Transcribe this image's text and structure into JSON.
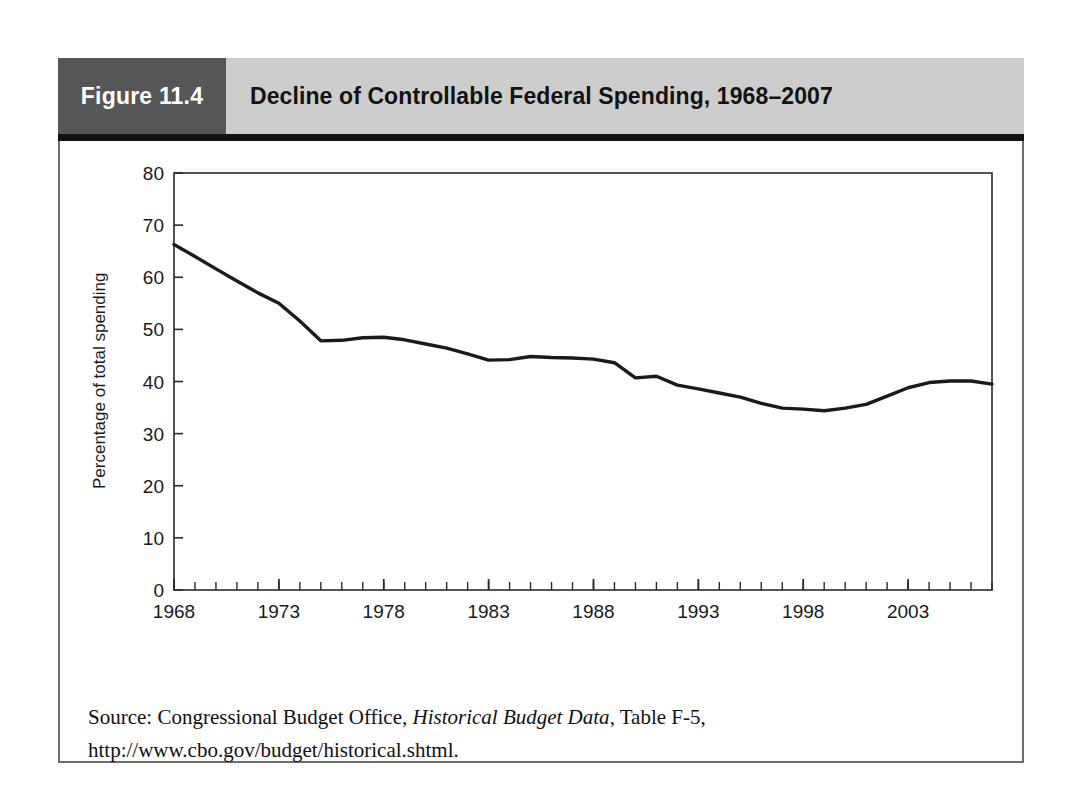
{
  "figure": {
    "number_label": "Figure 11.4",
    "title": "Decline of Controllable Federal Spending, 1968–2007",
    "source_prefix": "Source: Congressional Budget Office, ",
    "source_italic": "Historical Budget Data",
    "source_suffix": ", Table F-5, http://www.cbo.gov/budget/historical.shtml."
  },
  "colors": {
    "figure_number_bg": "#565656",
    "figure_title_bg": "#cdcdcd",
    "header_rule": "#111111",
    "box_border": "#6d6d6d",
    "axis": "#2b2b2b",
    "line": "#1a1a1a",
    "text": "#111111"
  },
  "chart_data": {
    "type": "line",
    "title": "Decline of Controllable Federal Spending, 1968–2007",
    "xlabel": "",
    "ylabel": "Percentage of total spending",
    "xlim": [
      1968,
      2007
    ],
    "ylim": [
      0,
      80
    ],
    "yticks": [
      0,
      10,
      20,
      30,
      40,
      50,
      60,
      70,
      80
    ],
    "ytick_labels": [
      "0",
      "10",
      "20",
      "30",
      "40",
      "50",
      "60",
      "70",
      "80"
    ],
    "xticks": [
      1968,
      1973,
      1978,
      1983,
      1988,
      1993,
      1998,
      2003
    ],
    "xtick_labels": [
      "1968",
      "1973",
      "1978",
      "1983",
      "1988",
      "1993",
      "1998",
      "2003"
    ],
    "minor_xtick_step": 1,
    "grid": false,
    "legend": false,
    "x": [
      1968,
      1969,
      1970,
      1971,
      1972,
      1973,
      1974,
      1975,
      1976,
      1977,
      1978,
      1979,
      1980,
      1981,
      1982,
      1983,
      1984,
      1985,
      1986,
      1987,
      1988,
      1989,
      1990,
      1991,
      1992,
      1993,
      1994,
      1995,
      1996,
      1997,
      1998,
      1999,
      2000,
      2001,
      2002,
      2003,
      2004,
      2005,
      2006,
      2007
    ],
    "values": [
      66.3,
      64.0,
      61.6,
      59.3,
      57.0,
      55.0,
      51.6,
      47.8,
      47.9,
      48.4,
      48.5,
      48.0,
      47.2,
      46.4,
      45.3,
      44.1,
      44.2,
      44.8,
      44.6,
      44.5,
      44.3,
      43.6,
      40.7,
      41.0,
      39.3,
      38.6,
      37.8,
      37.0,
      35.8,
      34.9,
      34.7,
      34.4,
      34.9,
      35.6,
      37.2,
      38.8,
      39.8,
      40.1,
      40.1,
      39.5
    ]
  }
}
